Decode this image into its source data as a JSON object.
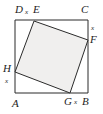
{
  "figure": {
    "type": "geometry-diagram",
    "colors": {
      "stroke": "#2b2b2b",
      "inner_fill": "#f0efee",
      "background": "#ffffff",
      "text": "#1d1d1d"
    },
    "outer_square": {
      "name": "ABCD",
      "vertices": [
        {
          "id": "A",
          "label": "A",
          "x": 15,
          "y": 93
        },
        {
          "id": "B",
          "label": "B",
          "x": 88,
          "y": 93
        },
        {
          "id": "C",
          "label": "C",
          "x": 88,
          "y": 20
        },
        {
          "id": "D",
          "label": "D",
          "x": 15,
          "y": 20
        }
      ]
    },
    "inner_square": {
      "name": "EFGH",
      "vertices": [
        {
          "id": "E",
          "label": "E",
          "x": 34,
          "y": 21
        },
        {
          "id": "F",
          "label": "F",
          "x": 88,
          "y": 40
        },
        {
          "id": "G",
          "label": "G",
          "x": 70,
          "y": 93
        },
        {
          "id": "H",
          "label": "H",
          "x": 15,
          "y": 72
        }
      ]
    },
    "segment_labels": [
      {
        "id": "x-DE",
        "label": "x",
        "on_segment": "DE",
        "x": 24,
        "y": 8
      },
      {
        "id": "x-CF",
        "label": "x",
        "on_segment": "CF",
        "x": 90,
        "y": 26
      },
      {
        "id": "x-BG",
        "label": "x",
        "on_segment": "GB",
        "x": 77,
        "y": 98
      },
      {
        "id": "x-AH",
        "label": "x",
        "on_segment": "HA",
        "x": 5,
        "y": 79
      }
    ],
    "vertex_label_positions": [
      {
        "id": "label-D",
        "label": "D",
        "x": 15,
        "y": 4
      },
      {
        "id": "label-E",
        "label": "E",
        "x": 33,
        "y": 4
      },
      {
        "id": "label-C",
        "label": "C",
        "x": 82,
        "y": 4
      },
      {
        "id": "label-F",
        "label": "F",
        "x": 90,
        "y": 35
      },
      {
        "id": "label-H",
        "label": "H",
        "x": 3,
        "y": 64
      },
      {
        "id": "label-A",
        "label": "A",
        "x": 13,
        "y": 99
      },
      {
        "id": "label-G",
        "label": "G",
        "x": 65,
        "y": 97
      },
      {
        "id": "label-B",
        "label": "B",
        "x": 83,
        "y": 97
      }
    ]
  }
}
